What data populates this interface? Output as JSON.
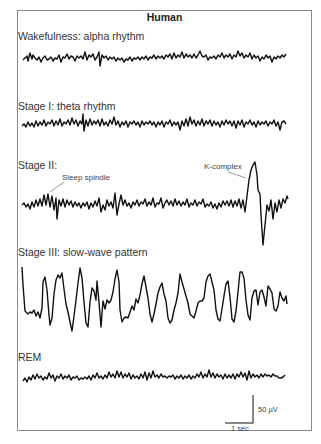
{
  "figure": {
    "title": "Human",
    "stages": [
      {
        "label": "Wakefulness: alpha rhythm"
      },
      {
        "label": "Stage I: theta rhythm"
      },
      {
        "label": "Stage II:"
      },
      {
        "label": "Stage III: slow-wave pattern"
      },
      {
        "label": "REM"
      }
    ],
    "annotations": {
      "sleep_spindle": "Sleep spindle",
      "k_complex": "K-complex"
    },
    "scale_bar": {
      "voltage": "50 µV",
      "time": "1 sec"
    },
    "colors": {
      "trace": "#111111",
      "frame": "#8a8a8a",
      "text": "#333333"
    }
  }
}
